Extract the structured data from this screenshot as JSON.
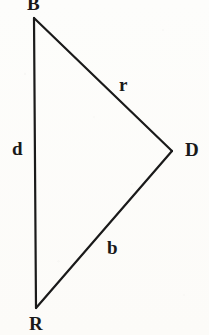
{
  "figure": {
    "kind": "geometric-triangle-diagram",
    "width": 209,
    "height": 335,
    "background_color": "#fdfdfb",
    "ink_color": "#1a1a1a"
  },
  "vertices": [
    {
      "id": "B",
      "label": "B",
      "x": 34,
      "y": 18,
      "label_x": 27,
      "label_y": -6,
      "clipped_by_top_edge": true
    },
    {
      "id": "D",
      "label": "D",
      "x": 172,
      "y": 151,
      "label_x": 185,
      "label_y": 140,
      "clipped_by_top_edge": false
    },
    {
      "id": "R",
      "label": "R",
      "x": 36,
      "y": 308,
      "label_x": 29,
      "label_y": 314,
      "clipped_by_top_edge": false
    }
  ],
  "sides": [
    {
      "id": "d",
      "label": "d",
      "from": "B",
      "to": "R",
      "label_x": 12,
      "label_y": 139,
      "orientation": "vertical-left"
    },
    {
      "id": "r",
      "label": "r",
      "from": "B",
      "to": "D",
      "label_x": 119,
      "label_y": 75,
      "orientation": "upper-diagonal"
    },
    {
      "id": "b",
      "label": "b",
      "from": "D",
      "to": "R",
      "label_x": 107,
      "label_y": 238,
      "orientation": "lower-diagonal"
    }
  ],
  "stroke": {
    "width": 2.1,
    "color": "#1a1a1a"
  }
}
